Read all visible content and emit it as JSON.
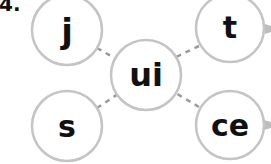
{
  "exercise": {
    "number": "4."
  },
  "diagram": {
    "center": {
      "text": "ui"
    },
    "nodes": [
      {
        "id": "top-left",
        "text": "j"
      },
      {
        "id": "top-right",
        "text": "t"
      },
      {
        "id": "bottom-left",
        "text": "s"
      },
      {
        "id": "bottom-right",
        "text": "ce"
      }
    ]
  },
  "colors": {
    "circle_stroke": "#c4c4c4",
    "connector": "#9a9a9a",
    "text": "#111111"
  }
}
